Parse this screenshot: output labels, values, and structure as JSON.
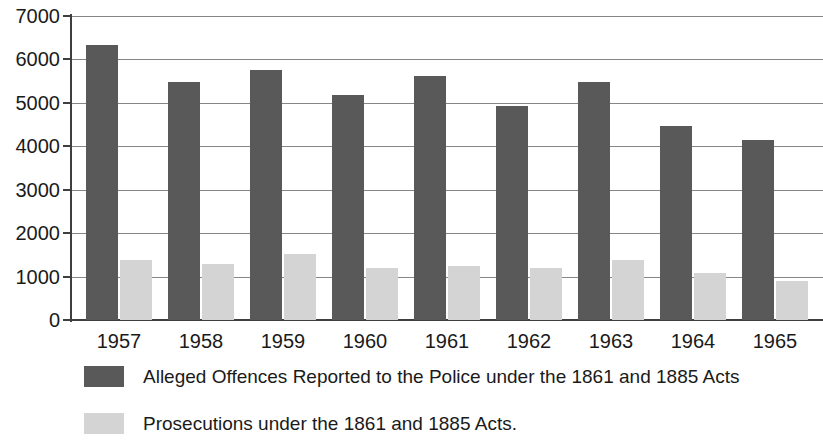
{
  "chart_data": {
    "type": "bar",
    "title": "",
    "subtitle": "",
    "xlabel": "",
    "ylabel": "",
    "ylim": [
      0,
      7000
    ],
    "ytick_step": 1000,
    "yticks": [
      0,
      1000,
      2000,
      3000,
      4000,
      5000,
      6000,
      7000
    ],
    "ytick_labels": [
      "0",
      "1000",
      "2000",
      "3000",
      "4000",
      "5000",
      "6000",
      "7000"
    ],
    "grid": true,
    "grid_axis": "y",
    "legend_position": "bottom-left",
    "categories": [
      "1957",
      "1958",
      "1959",
      "1960",
      "1961",
      "1962",
      "1963",
      "1964",
      "1965"
    ],
    "series": [
      {
        "name": "Alleged Offences Reported to the Police under the 1861 and 1885 Acts",
        "color": "#595959",
        "values": [
          6330,
          5470,
          5760,
          5180,
          5630,
          4930,
          5470,
          4470,
          4140
        ]
      },
      {
        "name": "Prosecutions under the 1861 and 1885 Acts.",
        "color": "#d4d4d4",
        "values": [
          1380,
          1300,
          1520,
          1190,
          1250,
          1190,
          1380,
          1080,
          890
        ]
      }
    ]
  },
  "legend": {
    "items": [
      {
        "label": "Alleged Offences Reported to the Police under the 1861 and 1885 Acts",
        "swatch": "dark-grey-swatch"
      },
      {
        "label": "Prosecutions under the 1861 and 1885 Acts.",
        "swatch": "light-grey-swatch"
      }
    ]
  },
  "colors": {
    "series_dark": "#595959",
    "series_light": "#d4d4d4",
    "gridline": "#868686",
    "axis": "#3f3f3f",
    "text": "#1a1a1a",
    "background": "#ffffff"
  }
}
